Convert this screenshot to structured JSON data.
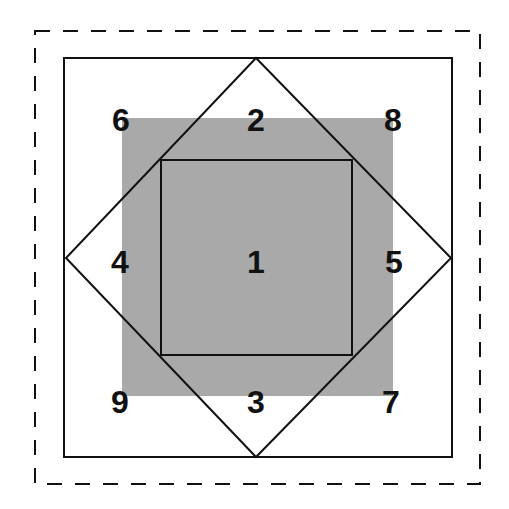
{
  "diagram": {
    "colors": {
      "background": "#ffffff",
      "line": "#111111",
      "shade": "#a9a9a9"
    },
    "outer_dashed_border": {
      "x": 35,
      "y": 31,
      "w": 445,
      "h": 453,
      "style": "dashed"
    },
    "outer_square": {
      "x": 64,
      "y": 58,
      "w": 388,
      "h": 399
    },
    "diamond": {
      "top": [
        256,
        58
      ],
      "right": [
        451,
        258
      ],
      "bottom": [
        256,
        457
      ],
      "left": [
        66,
        258
      ]
    },
    "shaded_region": {
      "x": 122,
      "y": 118,
      "w": 271,
      "h": 278
    },
    "inner_square": {
      "x": 161,
      "y": 160,
      "w": 191,
      "h": 195
    },
    "labels": [
      {
        "id": "1",
        "text": "1",
        "x": 256,
        "y": 262
      },
      {
        "id": "2",
        "text": "2",
        "x": 256,
        "y": 120
      },
      {
        "id": "3",
        "text": "3",
        "x": 256,
        "y": 402
      },
      {
        "id": "4",
        "text": "4",
        "x": 120,
        "y": 262
      },
      {
        "id": "5",
        "text": "5",
        "x": 394,
        "y": 262
      },
      {
        "id": "6",
        "text": "6",
        "x": 121,
        "y": 120
      },
      {
        "id": "7",
        "text": "7",
        "x": 391,
        "y": 402
      },
      {
        "id": "8",
        "text": "8",
        "x": 393,
        "y": 120
      },
      {
        "id": "9",
        "text": "9",
        "x": 120,
        "y": 402
      }
    ]
  }
}
